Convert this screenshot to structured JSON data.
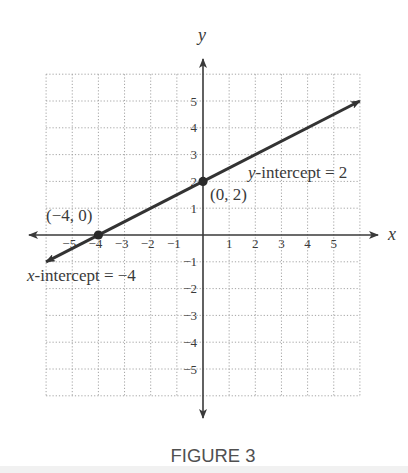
{
  "figure": {
    "caption": "FIGURE 3"
  },
  "colors": {
    "axis": "#3a3a3a",
    "line": "#333333",
    "grid": "#9a9a9a",
    "text": "#3a3a3a",
    "caption": "#505050"
  },
  "chart_data": {
    "type": "line",
    "title": "",
    "xlabel": "x",
    "ylabel": "y",
    "xlim": [
      -6,
      6
    ],
    "ylim": [
      -6,
      6
    ],
    "grid": true,
    "grid_style": "dotted",
    "x_ticks": [
      -5,
      -4,
      -3,
      -2,
      -1,
      1,
      2,
      3,
      4,
      5
    ],
    "y_ticks": [
      5,
      4,
      3,
      2,
      1,
      -1,
      -2,
      -3,
      -4,
      -5
    ],
    "x_tick_labels": [
      "−5",
      "−4",
      "−3",
      "−2",
      "−1",
      "1",
      "2",
      "3",
      "4",
      "5"
    ],
    "y_tick_labels": [
      "5",
      "4",
      "3",
      "2",
      "1",
      "−1",
      "−2",
      "−3",
      "−4",
      "−5"
    ],
    "series": [
      {
        "name": "y = x/2 + 2",
        "x": [
          -6,
          6
        ],
        "y": [
          -1,
          5
        ],
        "arrows": "both"
      }
    ],
    "points": [
      {
        "x": -4,
        "y": 0,
        "label": "(−4, 0)"
      },
      {
        "x": 0,
        "y": 2,
        "label": "(0, 2)"
      }
    ],
    "annotations": [
      {
        "text": "y-intercept = 2",
        "italic_prefix": "y",
        "rest": "-intercept = 2"
      },
      {
        "text": "x-intercept = −4",
        "italic_prefix": "x",
        "rest": "-intercept = −4"
      }
    ],
    "legend": null
  }
}
